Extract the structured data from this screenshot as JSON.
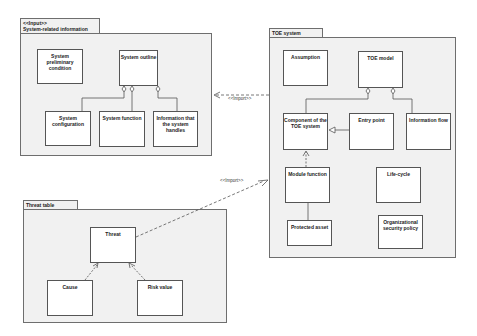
{
  "packages": {
    "system_info": {
      "stereotype": "<<Input>>",
      "title": "System-related information",
      "classes": {
        "preliminary": "System preliminary condition",
        "outline": "System outline",
        "configuration": "System configuration",
        "function": "System function",
        "info_handles": "Information that the system handles"
      }
    },
    "toe": {
      "title": "TOE system",
      "classes": {
        "assumption": "Assumption",
        "model": "TOE model",
        "component": "Component of the TOE system",
        "entry": "Entry point",
        "info_flow": "Information flow",
        "module": "Module function",
        "lifecycle": "Life-cycle",
        "asset": "Protected asset",
        "policy": "Organizational security policy"
      }
    },
    "threat": {
      "title": "Threat table",
      "classes": {
        "threat": "Threat",
        "cause": "Cause",
        "risk": "Risk value"
      }
    }
  },
  "relations": {
    "import_label_1": "<<Import>>",
    "import_label_2": "<<Import>>"
  },
  "colors": {
    "package_fill": "#f1f1f1",
    "border": "#555555"
  }
}
